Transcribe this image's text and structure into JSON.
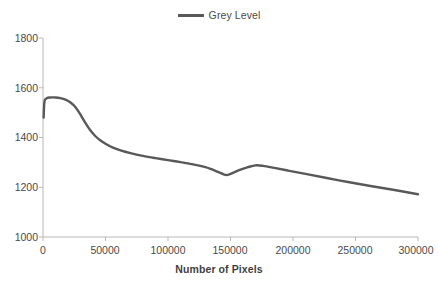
{
  "chart_data": {
    "type": "line",
    "title": "",
    "xlabel": "Number of Pixels",
    "ylabel": "",
    "xlim": [
      0,
      300000
    ],
    "ylim": [
      1000,
      1800
    ],
    "grid": false,
    "legend_position": "top-center",
    "legend": [
      "Grey Level"
    ],
    "xticks": [
      "0",
      "50000",
      "100000",
      "150000",
      "200000",
      "250000",
      "300000"
    ],
    "xtick_values": [
      0,
      50000,
      100000,
      150000,
      200000,
      250000,
      300000
    ],
    "yticks": [
      "1000",
      "1200",
      "1400",
      "1600",
      "1800"
    ],
    "ytick_values": [
      1000,
      1200,
      1400,
      1600,
      1800
    ],
    "series": [
      {
        "name": "Grey Level",
        "color": "#595959",
        "line_width": 2.4,
        "x": [
          500,
          1200,
          3000,
          6000,
          10000,
          14000,
          18000,
          22000,
          26000,
          30000,
          34000,
          38000,
          42000,
          46000,
          50000,
          56000,
          62000,
          70000,
          80000,
          90000,
          100000,
          110000,
          120000,
          130000,
          140000,
          145000,
          148000,
          152000,
          158000,
          164000,
          170000,
          176000,
          184000,
          196000,
          210000,
          226000,
          244000,
          262000,
          280000,
          300000
        ],
        "y": [
          1480,
          1545,
          1558,
          1561,
          1561,
          1558,
          1552,
          1541,
          1522,
          1492,
          1458,
          1428,
          1405,
          1388,
          1375,
          1359,
          1348,
          1337,
          1326,
          1317,
          1309,
          1301,
          1292,
          1281,
          1262,
          1251,
          1250,
          1258,
          1271,
          1281,
          1288,
          1286,
          1279,
          1267,
          1254,
          1238,
          1221,
          1205,
          1190,
          1172
        ]
      }
    ]
  },
  "legend": {
    "items": [
      {
        "label": "Grey Level",
        "swatch_color": "#595959"
      }
    ]
  },
  "axes": {
    "x_title": "Number of Pixels",
    "x_tick_labels": [
      "0",
      "50000",
      "100000",
      "150000",
      "200000",
      "250000",
      "300000"
    ],
    "y_tick_labels": [
      "1800",
      "1600",
      "1400",
      "1200",
      "1000"
    ]
  },
  "colors": {
    "series": "#595959",
    "axis": "#b8b8b8",
    "text": "#4a4a4a"
  }
}
